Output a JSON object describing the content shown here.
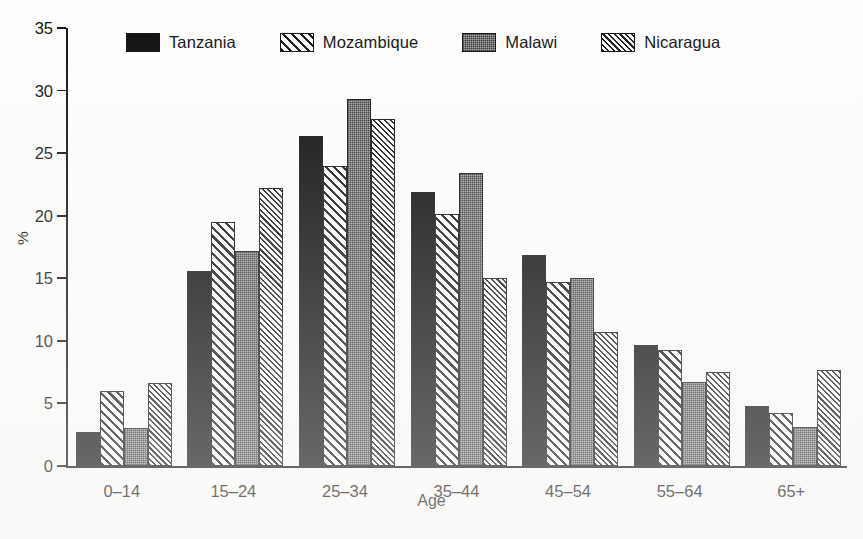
{
  "chart_data": {
    "type": "bar",
    "title": "",
    "xlabel": "Age",
    "ylabel": "%",
    "ylim": [
      0,
      35
    ],
    "yticks": [
      0,
      5,
      10,
      15,
      20,
      25,
      30,
      35
    ],
    "grid": false,
    "legend_position": "top",
    "categories": [
      "0–14",
      "15–24",
      "25–34",
      "35–44",
      "45–54",
      "55–64",
      "65+"
    ],
    "series": [
      {
        "name": "Tanzania",
        "pattern": "solid-black",
        "values": [
          2.7,
          15.6,
          26.4,
          21.9,
          16.9,
          9.7,
          4.8
        ]
      },
      {
        "name": "Mozambique",
        "pattern": "wide-diagonal-hatch",
        "values": [
          6.0,
          19.5,
          24.0,
          20.1,
          14.7,
          9.3,
          4.2
        ]
      },
      {
        "name": "Malawi",
        "pattern": "gray-stipple",
        "values": [
          3.0,
          17.2,
          29.3,
          23.4,
          15.0,
          6.7,
          3.1
        ]
      },
      {
        "name": "Nicaragua",
        "pattern": "fine-diagonal-hatch",
        "values": [
          6.6,
          22.2,
          27.7,
          15.0,
          10.7,
          7.5,
          7.7
        ]
      }
    ]
  },
  "legend": {
    "items": [
      {
        "label": "Tanzania",
        "swatch": "legend-swatch-tanzania"
      },
      {
        "label": "Mozambique",
        "swatch": "legend-swatch-mozambique"
      },
      {
        "label": "Malawi",
        "swatch": "legend-swatch-malawi"
      },
      {
        "label": "Nicaragua",
        "swatch": "legend-swatch-nicaragua"
      }
    ]
  },
  "colors": {
    "ink": "#111111",
    "solid_fill": "#0d0d0d",
    "stipple_fill": "#a9a9a9",
    "paper": "#fdfdfc"
  }
}
